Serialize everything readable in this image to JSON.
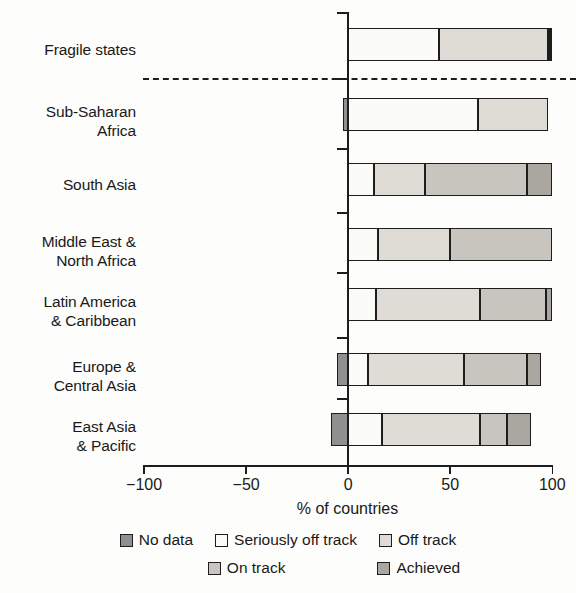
{
  "chart_data": {
    "type": "bar",
    "orientation": "horizontal",
    "stacked": true,
    "title": "",
    "xlabel": "% of countries",
    "ylabel": "",
    "xlim": [
      -100,
      100
    ],
    "xticks": [
      -100,
      -50,
      0,
      50,
      100
    ],
    "xticklabels": [
      "−100",
      "−50",
      "0",
      "50",
      "100"
    ],
    "grid": false,
    "legend_position": "bottom",
    "divider_after_category": "Fragile states",
    "categories": [
      "Fragile states",
      "Sub-Saharan Africa",
      "South Asia",
      "Middle East & North Africa",
      "Latin America & Caribbean",
      "Europe & Central Asia",
      "East Asia & Pacific"
    ],
    "category_label_lines": [
      [
        "Fragile states"
      ],
      [
        "Sub-Saharan",
        "Africa"
      ],
      [
        "South Asia"
      ],
      [
        "Middle East &",
        "North Africa"
      ],
      [
        "Latin America",
        "& Caribbean"
      ],
      [
        "Europe &",
        "Central Asia"
      ],
      [
        "East Asia",
        "& Pacific"
      ]
    ],
    "series": [
      {
        "name": "No data",
        "color": "#8f8f8f",
        "values": [
          0,
          -2,
          0,
          0,
          0,
          -5,
          -8
        ]
      },
      {
        "name": "Seriously off track",
        "color": "#fbfbf8",
        "values": [
          45,
          64,
          13,
          15,
          14,
          10,
          17
        ]
      },
      {
        "name": "Off track",
        "color": "#dedcd5",
        "values": [
          53,
          34,
          25,
          35,
          51,
          47,
          48
        ]
      },
      {
        "name": "On track",
        "color": "#c7c5be",
        "values": [
          1,
          0,
          50,
          50,
          32,
          31,
          13
        ]
      },
      {
        "name": "Achieved",
        "color": "#a9a7a0",
        "values": [
          1,
          0,
          12,
          0,
          3,
          7,
          12
        ]
      }
    ]
  },
  "legend": {
    "row1": [
      {
        "label": "No data",
        "color": "#8f8f8f"
      },
      {
        "label": "Seriously off track",
        "color": "#fbfbf8"
      },
      {
        "label": "Off track",
        "color": "#dedcd5"
      }
    ],
    "row2": [
      {
        "label": "On track",
        "color": "#c7c5be"
      },
      {
        "label": "Achieved",
        "color": "#a9a7a0"
      }
    ]
  },
  "colors": {
    "axis": "#1d1d1d",
    "text": "#191919",
    "background": "#fdfdfb"
  }
}
